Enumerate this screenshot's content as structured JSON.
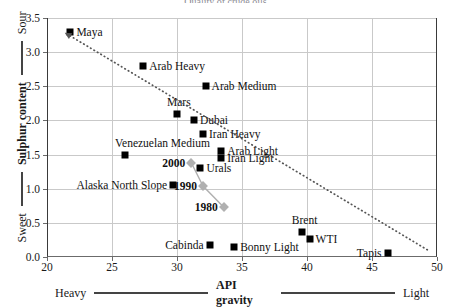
{
  "chart_data": {
    "type": "scatter",
    "title": "Quality of crude oils",
    "xlabel": "API gravity",
    "ylabel": "Sulphur content",
    "xlim": [
      20,
      50
    ],
    "ylim": [
      0.0,
      3.5
    ],
    "xticks": [
      20,
      25,
      30,
      35,
      40,
      45,
      50
    ],
    "yticks": [
      "0.0",
      "0.5",
      "1.0",
      "1.5",
      "2.0",
      "2.5",
      "3.0",
      "3.5"
    ],
    "grid": true,
    "legend": "none",
    "x_axis_left_tag": "Heavy",
    "x_axis_right_tag": "Light",
    "y_axis_low_tag": "Sweet",
    "y_axis_high_tag": "Sour",
    "series": [
      {
        "name": "Crude oils",
        "marker": "square",
        "color": "#000000",
        "points": [
          {
            "label": "Maya",
            "x": 21.8,
            "y": 3.3,
            "label_side": "right"
          },
          {
            "label": "Arab Heavy",
            "x": 27.4,
            "y": 2.8,
            "label_side": "right"
          },
          {
            "label": "Arab Medium",
            "x": 32.2,
            "y": 2.5,
            "label_side": "right"
          },
          {
            "label": "Mars",
            "x": 30.0,
            "y": 2.1,
            "label_side": "above"
          },
          {
            "label": "Dubai",
            "x": 31.3,
            "y": 2.0,
            "label_side": "right"
          },
          {
            "label": "Iran Heavy",
            "x": 32.0,
            "y": 1.8,
            "label_side": "right"
          },
          {
            "label": "Arab Light",
            "x": 33.4,
            "y": 1.55,
            "label_side": "right"
          },
          {
            "label": "Iran Light",
            "x": 33.4,
            "y": 1.45,
            "label_side": "right"
          },
          {
            "label": "Venezuelan Medium",
            "x": 26.0,
            "y": 1.5,
            "label_side": "above"
          },
          {
            "label": "Urals",
            "x": 31.8,
            "y": 1.3,
            "label_side": "right"
          },
          {
            "label": "Alaska North Slope",
            "x": 29.7,
            "y": 1.05,
            "label_side": "left"
          },
          {
            "label": "Cabinda",
            "x": 32.5,
            "y": 0.17,
            "label_side": "left"
          },
          {
            "label": "Bonny Light",
            "x": 34.4,
            "y": 0.14,
            "label_side": "right"
          },
          {
            "label": "Brent",
            "x": 39.6,
            "y": 0.37,
            "label_side": "above"
          },
          {
            "label": "WTI",
            "x": 40.2,
            "y": 0.27,
            "label_side": "right"
          },
          {
            "label": "Tapis",
            "x": 46.2,
            "y": 0.06,
            "label_side": "left"
          }
        ]
      },
      {
        "name": "Average crude slate by year",
        "marker": "diamond",
        "color": "#b0b0b0",
        "connected": true,
        "points": [
          {
            "label": "2000",
            "x": 31.1,
            "y": 1.38,
            "label_side": "left"
          },
          {
            "label": "1990",
            "x": 32.0,
            "y": 1.04,
            "label_side": "left"
          },
          {
            "label": "1980",
            "x": 33.6,
            "y": 0.73,
            "label_side": "left"
          }
        ]
      }
    ],
    "trendline": {
      "style": "dotted",
      "color": "#555555",
      "arrow_at": "start",
      "x_start": 21.5,
      "y_start": 3.27,
      "x_end": 49.3,
      "y_end": 0.1
    }
  }
}
